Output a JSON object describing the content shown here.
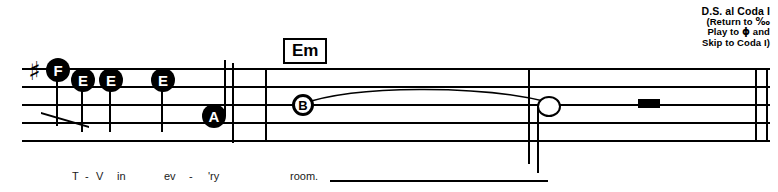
{
  "direction": {
    "line1": "D.S. al Coda I",
    "line2_pre": "(Return to ",
    "line2_symbol": "‰",
    "line3_pre": "Play to ",
    "line3_symbol": "ϕ",
    "line3_post": " and",
    "line4": "Skip to Coda I)"
  },
  "chords": [
    {
      "label": "Em",
      "x": 283,
      "y": 38
    }
  ],
  "key_signature": {
    "symbol": "♯",
    "x": 28,
    "y": 58
  },
  "notes": [
    {
      "letter": "F",
      "style": "filled",
      "x": 46,
      "y": 58
    },
    {
      "letter": "E",
      "style": "filled",
      "x": 71,
      "y": 68
    },
    {
      "letter": "E",
      "style": "filled",
      "x": 99,
      "y": 68
    },
    {
      "letter": "E",
      "style": "filled",
      "x": 151,
      "y": 68
    },
    {
      "letter": "A",
      "style": "filled",
      "x": 202,
      "y": 104
    },
    {
      "letter": "B",
      "style": "ring",
      "x": 292,
      "y": 94
    },
    {
      "letter": "",
      "style": "open",
      "x": 537,
      "y": 96
    }
  ],
  "stems": [
    {
      "x": 56,
      "y": 70,
      "h": 56
    },
    {
      "x": 81,
      "y": 80,
      "h": 52
    },
    {
      "x": 109,
      "y": 80,
      "h": 52
    },
    {
      "x": 161,
      "y": 80,
      "h": 52
    },
    {
      "x": 224,
      "y": 60,
      "h": 56
    },
    {
      "x": 537,
      "y": 105,
      "h": 68
    }
  ],
  "beam": {
    "x": 41,
    "y": 112,
    "w": 48,
    "h": 16
  },
  "barlines": [
    {
      "x": 232,
      "y": 63,
      "h": 80
    },
    {
      "x": 265,
      "y": 68,
      "h": 74
    },
    {
      "x": 528,
      "y": 68,
      "h": 96
    },
    {
      "x": 755,
      "y": 68,
      "h": 74
    },
    {
      "x": 766,
      "y": 68,
      "h": 74
    }
  ],
  "rest": {
    "x": 638,
    "y": 99,
    "w": 22,
    "h": 9
  },
  "tie": {
    "x": 300,
    "y": 84,
    "w": 250,
    "h": 22
  },
  "lyrics": {
    "syllables": [
      {
        "text": "T",
        "x": 72,
        "y": 170
      },
      {
        "text": "-",
        "x": 85,
        "y": 170
      },
      {
        "text": "V",
        "x": 96,
        "y": 170
      },
      {
        "text": "in",
        "x": 117,
        "y": 170
      },
      {
        "text": "ev",
        "x": 164,
        "y": 170
      },
      {
        "text": "-",
        "x": 189,
        "y": 170
      },
      {
        "text": "'ry",
        "x": 208,
        "y": 170
      },
      {
        "text": "room.",
        "x": 290,
        "y": 170
      }
    ],
    "extension": {
      "x": 330,
      "y": 180,
      "w": 218
    }
  }
}
